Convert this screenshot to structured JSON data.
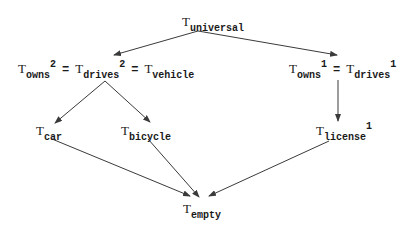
{
  "diagram": {
    "nodes": {
      "universal": {
        "base": "T",
        "sub": "universal"
      },
      "left": {
        "terms": [
          {
            "base": "T",
            "sub": "owns",
            "sup": "2"
          },
          {
            "base": "T",
            "sub": "drives",
            "sup": "2"
          },
          {
            "base": "T",
            "sub": "vehicle"
          }
        ],
        "eq": "="
      },
      "right": {
        "terms": [
          {
            "base": "T",
            "sub": "owns",
            "sup": "1"
          },
          {
            "base": "T",
            "sub": "drives",
            "sup": "1"
          }
        ],
        "eq": "="
      },
      "car": {
        "base": "T",
        "sub": "car"
      },
      "bicycle": {
        "base": "T",
        "sub": "bicycle"
      },
      "license": {
        "base": "T",
        "sub": "license",
        "sup": "1"
      },
      "empty": {
        "base": "T",
        "sub": "empty"
      }
    },
    "edges": [
      {
        "from": "universal",
        "to": "owns2=drives2=vehicle"
      },
      {
        "from": "universal",
        "to": "owns1=drives1"
      },
      {
        "from": "owns2=drives2=vehicle",
        "to": "car"
      },
      {
        "from": "owns2=drives2=vehicle",
        "to": "bicycle"
      },
      {
        "from": "owns1=drives1",
        "to": "license1"
      },
      {
        "from": "car",
        "to": "empty"
      },
      {
        "from": "bicycle",
        "to": "empty"
      },
      {
        "from": "license1",
        "to": "empty"
      }
    ],
    "colors": {
      "line": "#3a3a3a",
      "text": "#1a1a1a",
      "background": "#ffffff"
    }
  }
}
